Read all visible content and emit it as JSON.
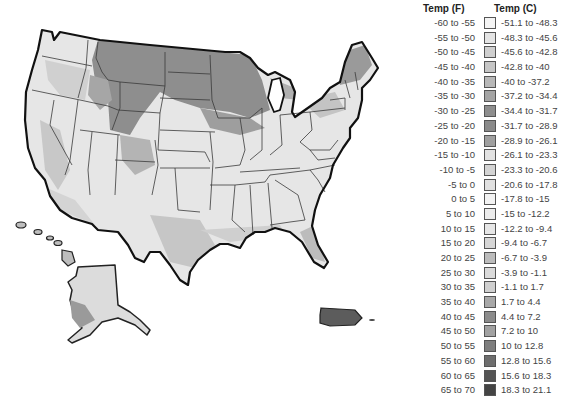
{
  "legend": {
    "header_f": "Temp (F)",
    "header_c": "Temp (C)",
    "rows": [
      {
        "f": "-60 to -55",
        "c": "-51.1 to -48.3",
        "color": "#f4f4f4"
      },
      {
        "f": "-55 to -50",
        "c": "-48.3 to -45.6",
        "color": "#e4e4e4"
      },
      {
        "f": "-50 to -45",
        "c": "-45.6 to -42.8",
        "color": "#cfcfcf"
      },
      {
        "f": "-45 to -40",
        "c": "-42.8 to -40",
        "color": "#c6c6c6"
      },
      {
        "f": "-40 to -35",
        "c": "-40 to -37.2",
        "color": "#b8b8b8"
      },
      {
        "f": "-35 to -30",
        "c": "-37.2 to -34.4",
        "color": "#a4a4a4"
      },
      {
        "f": "-30 to -25",
        "c": "-34.4 to -31.7",
        "color": "#8e8e8e"
      },
      {
        "f": "-25 to -20",
        "c": "-31.7 to -28.9",
        "color": "#8a8a8a"
      },
      {
        "f": "-20 to -15",
        "c": "-28.9 to -26.1",
        "color": "#a0a0a0"
      },
      {
        "f": "-15 to -10",
        "c": "-26.1 to -23.3",
        "color": "#e2e2e2"
      },
      {
        "f": "-10 to -5",
        "c": "-23.3 to -20.6",
        "color": "#d4d4d4"
      },
      {
        "f": "-5 to 0",
        "c": "-20.6 to -17.8",
        "color": "#e0e0e0"
      },
      {
        "f": "0 to 5",
        "c": "-17.8 to -15",
        "color": "#f2f2f2"
      },
      {
        "f": "5 to 10",
        "c": "-15 to -12.2",
        "color": "#ececec"
      },
      {
        "f": "10 to 15",
        "c": "-12.2 to -9.4",
        "color": "#e6e6e6"
      },
      {
        "f": "15 to 20",
        "c": "-9.4 to -6.7",
        "color": "#d6d6d6"
      },
      {
        "f": "20 to 25",
        "c": "-6.7 to -3.9",
        "color": "#bcbcbc"
      },
      {
        "f": "25 to 30",
        "c": "-3.9 to -1.1",
        "color": "#dadada"
      },
      {
        "f": "30 to 35",
        "c": "-1.1 to 1.7",
        "color": "#d0d0d0"
      },
      {
        "f": "35 to 40",
        "c": "1.7 to 4.4",
        "color": "#a8a8a8"
      },
      {
        "f": "40 to 45",
        "c": "4.4 to 7.2",
        "color": "#8c8c8c"
      },
      {
        "f": "45 to 50",
        "c": "7.2 to 10",
        "color": "#a2a2a2"
      },
      {
        "f": "50 to 55",
        "c": "10 to 12.8",
        "color": "#7e7e7e"
      },
      {
        "f": "55 to 60",
        "c": "12.8 to 15.6",
        "color": "#6e6e6e"
      },
      {
        "f": "60 to 65",
        "c": "15.6 to 18.3",
        "color": "#545454"
      },
      {
        "f": "65 to 70",
        "c": "18.3 to 21.1",
        "color": "#444444"
      }
    ]
  },
  "map": {
    "regions": [
      "Contiguous United States",
      "Alaska",
      "Hawaii",
      "Puerto Rico"
    ],
    "colors": {
      "outline": "#1a1a1a",
      "state_border": "#3a3a3a",
      "light": "#e8e8e8",
      "mid": "#cfcfcf",
      "dark_north": "#8a8a8a",
      "puerto_rico": "#5a5a5a"
    }
  }
}
